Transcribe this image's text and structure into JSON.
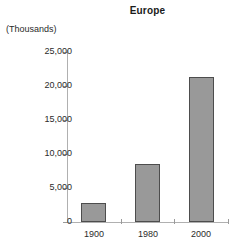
{
  "chart_data": {
    "type": "bar",
    "title": "Europe",
    "xlabel": "",
    "ylabel": "(Thousands)",
    "categories": [
      "1900",
      "1980",
      "2000"
    ],
    "values": [
      2800,
      8500,
      21300
    ],
    "ylim": [
      0,
      25000
    ],
    "ytick_labels": [
      "0",
      "5,000",
      "10,000",
      "15,000",
      "20,000",
      "25,000"
    ],
    "ytick_values": [
      0,
      5000,
      10000,
      15000,
      20000,
      25000
    ],
    "grid": false,
    "legend": null,
    "series": [
      {
        "name": "Europe",
        "values": [
          2800,
          8500,
          21300
        ]
      }
    ],
    "colors": {
      "bar_fill": "#999999",
      "bar_border": "#4d4d4d",
      "axis": "#b0b0b0",
      "text": "#2b2b2b",
      "background": "#ffffff"
    }
  }
}
